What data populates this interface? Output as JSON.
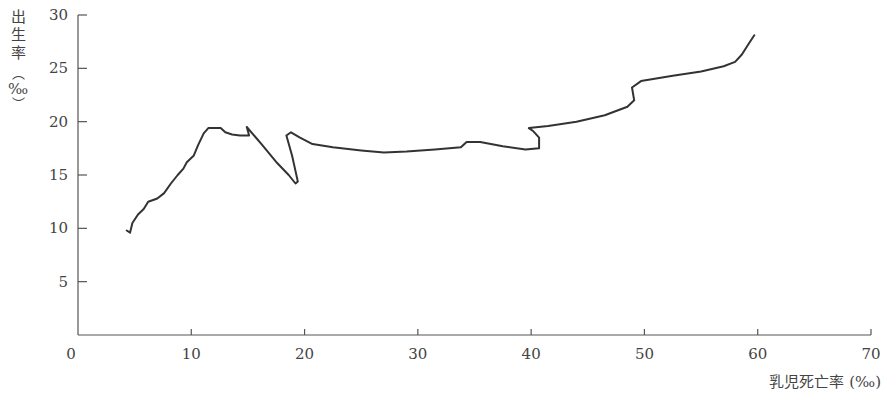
{
  "chart_data": {
    "type": "line",
    "title": "",
    "xlabel": "乳児死亡率 (‰)",
    "ylabel": "出生率 (‰)",
    "xlim": [
      0,
      70
    ],
    "ylim": [
      0,
      30
    ],
    "x_ticks": [
      0,
      10,
      20,
      30,
      40,
      50,
      60,
      70
    ],
    "y_ticks": [
      5,
      10,
      15,
      20,
      25,
      30
    ],
    "grid": false,
    "legend": null,
    "series": [
      {
        "name": "出生率 vs 乳児死亡率",
        "color": "#333333",
        "points": [
          [
            4.3,
            9.8
          ],
          [
            4.6,
            9.6
          ],
          [
            4.8,
            10.5
          ],
          [
            5.3,
            11.3
          ],
          [
            5.8,
            11.8
          ],
          [
            6.2,
            12.5
          ],
          [
            7.0,
            12.8
          ],
          [
            7.6,
            13.3
          ],
          [
            8.2,
            14.2
          ],
          [
            8.8,
            15.0
          ],
          [
            9.3,
            15.6
          ],
          [
            9.6,
            16.2
          ],
          [
            10.2,
            16.8
          ],
          [
            10.6,
            17.8
          ],
          [
            11.1,
            18.9
          ],
          [
            11.5,
            19.4
          ],
          [
            12.6,
            19.4
          ],
          [
            13.0,
            19.0
          ],
          [
            13.6,
            18.8
          ],
          [
            14.3,
            18.7
          ],
          [
            15.1,
            18.7
          ],
          [
            14.9,
            19.5
          ],
          [
            16.2,
            17.9
          ],
          [
            17.6,
            16.1
          ],
          [
            18.6,
            15.0
          ],
          [
            19.2,
            14.2
          ],
          [
            19.4,
            14.4
          ],
          [
            18.9,
            16.8
          ],
          [
            18.4,
            18.7
          ],
          [
            18.8,
            19.0
          ],
          [
            19.6,
            18.5
          ],
          [
            20.7,
            17.9
          ],
          [
            22.5,
            17.6
          ],
          [
            25.0,
            17.3
          ],
          [
            27.0,
            17.1
          ],
          [
            29.0,
            17.2
          ],
          [
            31.5,
            17.4
          ],
          [
            33.8,
            17.6
          ],
          [
            34.3,
            18.1
          ],
          [
            35.5,
            18.1
          ],
          [
            37.5,
            17.7
          ],
          [
            39.5,
            17.4
          ],
          [
            40.7,
            17.5
          ],
          [
            40.7,
            18.5
          ],
          [
            40.2,
            19.1
          ],
          [
            39.8,
            19.4
          ],
          [
            41.5,
            19.6
          ],
          [
            44.0,
            20.0
          ],
          [
            46.5,
            20.6
          ],
          [
            48.5,
            21.4
          ],
          [
            49.1,
            22.0
          ],
          [
            48.9,
            23.2
          ],
          [
            49.7,
            23.8
          ],
          [
            52.5,
            24.3
          ],
          [
            55.0,
            24.7
          ],
          [
            57.0,
            25.2
          ],
          [
            58.0,
            25.6
          ],
          [
            58.6,
            26.3
          ],
          [
            59.2,
            27.3
          ],
          [
            59.7,
            28.1
          ]
        ]
      }
    ]
  },
  "labels": {
    "ylabel_chars": [
      "出",
      "生",
      "率"
    ],
    "ylabel_paren_open": "︵",
    "ylabel_unit": "‰",
    "ylabel_paren_close": "︶",
    "xlabel": "乳児死亡率 (‰)"
  }
}
